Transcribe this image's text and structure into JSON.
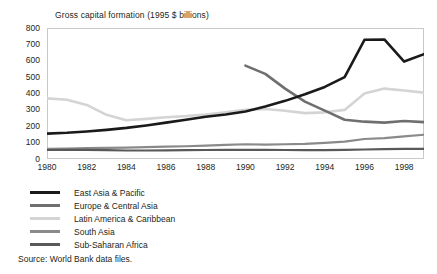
{
  "chart_data": {
    "type": "line",
    "title": "Gross capital formation (1995 $ billions)",
    "xlabel": "",
    "ylabel": "",
    "xlim": [
      1980,
      1999
    ],
    "ylim": [
      0,
      800
    ],
    "y_ticks": [
      0,
      100,
      200,
      300,
      400,
      500,
      600,
      700,
      800
    ],
    "x_ticks": [
      1980,
      1982,
      1984,
      1986,
      1988,
      1990,
      1992,
      1994,
      1996,
      1998
    ],
    "x": [
      1980,
      1981,
      1982,
      1983,
      1984,
      1985,
      1986,
      1987,
      1988,
      1989,
      1990,
      1991,
      1992,
      1993,
      1994,
      1995,
      1996,
      1997,
      1998,
      1999
    ],
    "grid": false,
    "legend_position": "below-plot",
    "series": [
      {
        "name": "East Asia & Pacific",
        "color": "#1a1a1a",
        "width": 2.6,
        "x": [
          1980,
          1981,
          1982,
          1983,
          1984,
          1985,
          1986,
          1987,
          1988,
          1989,
          1990,
          1991,
          1992,
          1993,
          1994,
          1995,
          1996,
          1997,
          1998,
          1999
        ],
        "values": [
          155,
          160,
          168,
          178,
          190,
          205,
          222,
          240,
          258,
          272,
          290,
          320,
          355,
          395,
          440,
          500,
          570,
          650,
          720,
          730
        ]
      },
      {
        "name": "Europe & Central Asia",
        "color": "#6f6f6f",
        "width": 2.6,
        "x": [
          1990,
          1991,
          1992,
          1993,
          1994,
          1995,
          1996,
          1997,
          1998,
          1999
        ],
        "values": [
          570,
          520,
          430,
          350,
          295,
          240,
          228,
          222,
          232,
          225
        ]
      },
      {
        "name": "Latin America & Caribbean",
        "color": "#d4d4d4",
        "width": 2.6,
        "x": [
          1980,
          1981,
          1982,
          1983,
          1984,
          1985,
          1986,
          1987,
          1988,
          1989,
          1990,
          1991,
          1992,
          1993,
          1994,
          1995,
          1996,
          1997,
          1998,
          1999
        ],
        "values": [
          370,
          362,
          330,
          270,
          237,
          245,
          255,
          262,
          272,
          285,
          300,
          305,
          295,
          280,
          285,
          300,
          320,
          340,
          362,
          358
        ]
      },
      {
        "name": "South Asia",
        "color": "#8a8a8a",
        "width": 2.2,
        "x": [
          1980,
          1981,
          1982,
          1983,
          1984,
          1985,
          1986,
          1987,
          1988,
          1989,
          1990,
          1991,
          1992,
          1993,
          1994,
          1995,
          1996,
          1997,
          1998,
          1999
        ],
        "values": [
          62,
          64,
          66,
          68,
          70,
          73,
          76,
          78,
          82,
          86,
          90,
          88,
          90,
          92,
          98,
          106,
          112,
          120,
          118,
          128
        ]
      },
      {
        "name": "Sub-Saharan Africa",
        "color": "#595959",
        "width": 2.2,
        "x": [
          1980,
          1981,
          1982,
          1983,
          1984,
          1985,
          1986,
          1987,
          1988,
          1989,
          1990,
          1991,
          1992,
          1993,
          1994,
          1995,
          1996,
          1997,
          1998,
          1999
        ],
        "values": [
          55,
          56,
          56,
          54,
          52,
          52,
          53,
          54,
          55,
          56,
          56,
          56,
          55,
          54,
          54,
          56,
          58,
          60,
          62,
          62
        ]
      }
    ],
    "series_tail": {
      "East Asia & Pacific": [
        1996,
        1997,
        1998,
        1999,
        2000
      ],
      "note": ""
    }
  },
  "chart_extra": {
    "east_asia_late": {
      "x": [
        1996,
        1997,
        1998,
        1999
      ],
      "values": [
        728,
        730,
        595,
        640
      ]
    },
    "latin_late": {
      "x": [
        1996,
        1997,
        1998,
        1999
      ],
      "values": [
        400,
        430,
        418,
        405
      ]
    },
    "south_asia_late": {
      "x": [
        1996,
        1997,
        1998,
        1999
      ],
      "values": [
        122,
        128,
        138,
        148
      ]
    }
  },
  "legend": {
    "items": [
      {
        "label": "East Asia & Pacific",
        "color": "#1a1a1a"
      },
      {
        "label": "Europe & Central Asia",
        "color": "#6f6f6f"
      },
      {
        "label": "Latin America & Caribbean",
        "color": "#d4d4d4"
      },
      {
        "label": "South Asia",
        "color": "#8a8a8a"
      },
      {
        "label": "Sub-Saharan Africa",
        "color": "#595959"
      }
    ]
  },
  "source": {
    "text": "Source: World Bank data files."
  },
  "frame": {
    "border_color": "#c9c9c9",
    "background": "#ffffff"
  }
}
